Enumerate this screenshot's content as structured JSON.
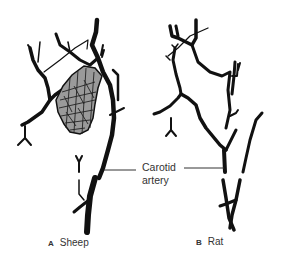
{
  "figure": {
    "panels": [
      {
        "letter": "A",
        "name": "Sheep"
      },
      {
        "letter": "B",
        "name": "Rat"
      }
    ],
    "callout": {
      "line1": "Carotid",
      "line2": "artery"
    },
    "colors": {
      "vessel": "#111111",
      "rete_fill": "#9a9a9a",
      "text": "#333333"
    }
  }
}
